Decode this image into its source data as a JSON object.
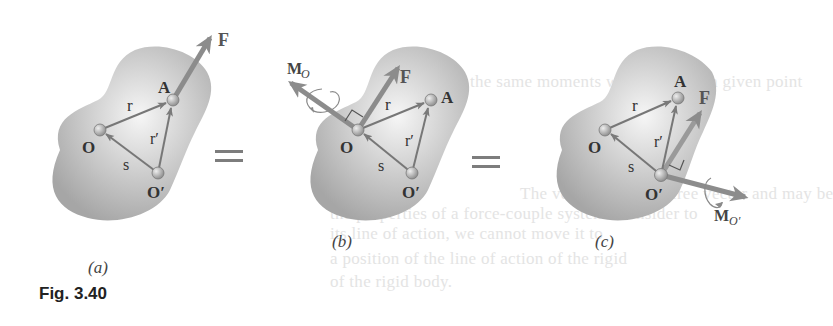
{
  "figure": {
    "caption": "Fig. 3.40",
    "equals_sign": "=",
    "colors": {
      "body_gradient_center": "#f4f4f4",
      "body_gradient_edge": "#a9a9a9",
      "vector": "#7f7f7f",
      "force_arrow": "#8c8c8c",
      "point": "#9a9a9a",
      "text": "#333333"
    },
    "panels": [
      {
        "id": "a",
        "caption": "(a)",
        "points": {
          "O": "O",
          "A": "A",
          "O_prime": "O′"
        },
        "vectors": {
          "r": "r",
          "r_prime": "r′",
          "s": "s"
        },
        "force": "F"
      },
      {
        "id": "b",
        "caption": "(b)",
        "points": {
          "O": "O",
          "A": "A",
          "O_prime": "O′"
        },
        "vectors": {
          "r": "r",
          "r_prime": "r′",
          "s": "s"
        },
        "force": "F",
        "moment": {
          "symbol": "M",
          "subscript": "O"
        }
      },
      {
        "id": "c",
        "caption": "(c)",
        "points": {
          "O": "O",
          "A": "A",
          "O_prime": "O′"
        },
        "vectors": {
          "r": "r",
          "r_prime": "r′",
          "s": "s"
        },
        "force": "F",
        "moment": {
          "symbol": "M",
          "subscript": "O′"
        }
      }
    ]
  },
  "background_showthrough": [
    "the same moments with regard to a given point",
    "The vector M_O is a free vector and may be",
    "the properties of a force-couple system. Consider to",
    "its line of action, we cannot move it to",
    "a position of the line of action of the rigid",
    "of the rigid body."
  ]
}
